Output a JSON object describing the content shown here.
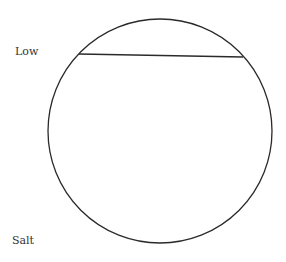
{
  "diagram": {
    "labels": {
      "top_left": "Low",
      "bottom_left": "Salt"
    },
    "shapes": {
      "circle": {
        "cx": 160,
        "cy": 131,
        "r": 112,
        "stroke": "#2a2a2a"
      },
      "chord": {
        "x1": 79,
        "y1": 54,
        "x2": 243,
        "y2": 57,
        "stroke": "#2a2a2a"
      }
    }
  }
}
